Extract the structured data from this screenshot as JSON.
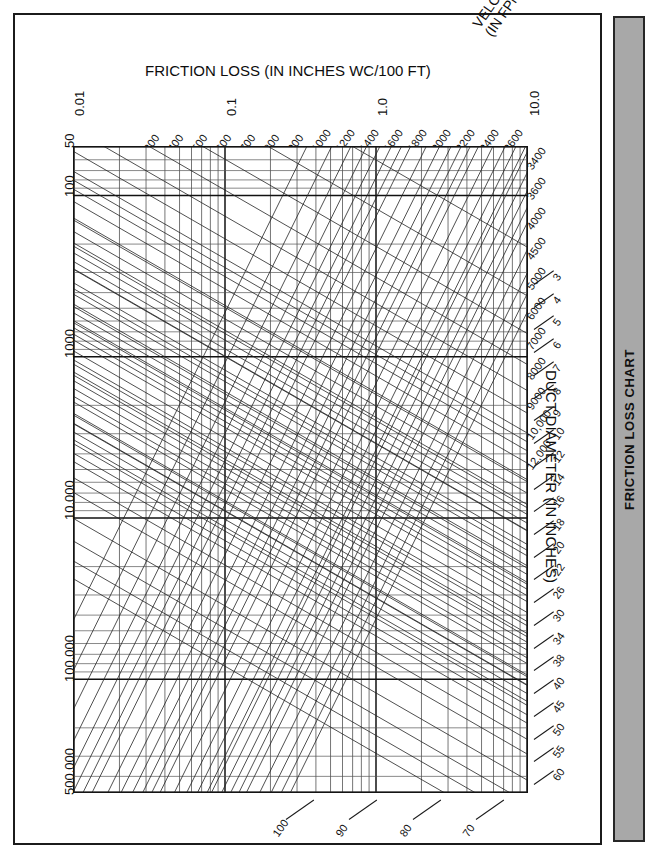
{
  "document": {
    "side_tab_label": "FRICTION LOSS CHART",
    "page_background": "#ffffff",
    "tab_color": "#a8a8a8",
    "frame_color": "#1b1b1b"
  },
  "axes": {
    "friction": {
      "title": "FRICTION LOSS (IN INCHES WC/100 FT)",
      "ticks": [
        "0.01",
        "0.1",
        "1.0",
        "10.0"
      ]
    },
    "airflow": {
      "title": "AIR FLOW RATE (IN CFM)",
      "ticks": [
        "50",
        "100",
        "1000",
        "10,000",
        "100,000",
        "500,000"
      ]
    },
    "velocity": {
      "title": "VELOCITY\n(IN FPM)",
      "title_line1": "VELOCITY",
      "title_line2": "(IN FPM)",
      "ticks": [
        "300",
        "400",
        "500",
        "600",
        "700",
        "800",
        "900",
        "1000",
        "1200",
        "1400",
        "1600",
        "1800",
        "2000",
        "2200",
        "2400",
        "2600",
        "3400",
        "3600",
        "4000",
        "4500",
        "5000",
        "6000",
        "7000",
        "8000",
        "9000",
        "10,000",
        "12,000"
      ]
    },
    "duct": {
      "title": "DUCT DIAMETER (IN INCHES)",
      "ticks": [
        "3",
        "4",
        "5",
        "6",
        "7",
        "8",
        "9",
        "10",
        "12",
        "14",
        "16",
        "18",
        "20",
        "22",
        "26",
        "30",
        "34",
        "38",
        "40",
        "45",
        "50",
        "55",
        "60",
        "70",
        "80",
        "90",
        "100"
      ]
    }
  },
  "chart_data": {
    "type": "line",
    "title": "FRICTION LOSS CHART",
    "subtitle": "Duct friction loss nomograph (log-log)",
    "xlabel": "FRICTION LOSS (IN INCHES WC/100 FT)",
    "ylabel": "AIR FLOW RATE (IN CFM)",
    "xscale": "log",
    "yscale": "log",
    "xlim": [
      0.01,
      10.0
    ],
    "ylim": [
      50,
      500000
    ],
    "grid": true,
    "legend": "none",
    "x_decade_ticks": [
      0.01,
      0.1,
      1.0,
      10.0
    ],
    "y_ticks": [
      50,
      100,
      1000,
      10000,
      100000,
      500000
    ],
    "series": [
      {
        "name": "velocity",
        "units": "FPM",
        "label": "VELOCITY (IN FPM)",
        "orientation": "diagonal-down-right",
        "values": [
          300,
          400,
          500,
          600,
          700,
          800,
          900,
          1000,
          1200,
          1400,
          1600,
          1800,
          2000,
          2200,
          2400,
          2600,
          3400,
          3600,
          4000,
          4500,
          5000,
          6000,
          7000,
          8000,
          9000,
          10000,
          12000
        ]
      },
      {
        "name": "duct_diameter",
        "units": "inches",
        "label": "DUCT DIAMETER (IN INCHES)",
        "orientation": "diagonal-up-right",
        "values": [
          3,
          4,
          5,
          6,
          7,
          8,
          9,
          10,
          12,
          14,
          16,
          18,
          20,
          22,
          26,
          30,
          34,
          38,
          40,
          45,
          50,
          55,
          60,
          70,
          80,
          90,
          100
        ]
      }
    ],
    "annotations": [
      "Log-log nomograph: air flow rate vs friction loss with overlaid velocity and duct-diameter families.",
      "Velocity lines run upper-left to lower-right; duct diameter lines run lower-left to upper-right."
    ]
  }
}
